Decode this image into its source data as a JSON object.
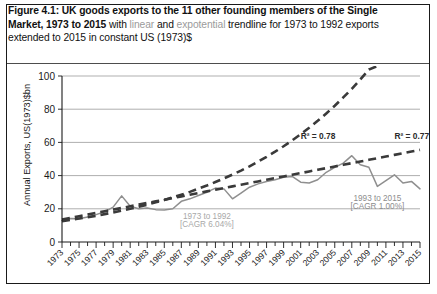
{
  "figure": {
    "caption": {
      "segments": [
        {
          "text": "Figure 4.1: UK goods exports to the 11 other founding members of the Single Market, 1973 to 2015",
          "style": "bold"
        },
        {
          "text": " with ",
          "style": "normal"
        },
        {
          "text": "linear",
          "style": "grey"
        },
        {
          "text": " and ",
          "style": "normal"
        },
        {
          "text": "expotential",
          "style": "grey"
        },
        {
          "text": " trendline for 1973 to 1992 exports extended to 2015 in constant US (1973)$",
          "style": "normal"
        }
      ]
    }
  },
  "chart_data": {
    "type": "line",
    "title": "UK goods exports to the 11 other founding members of the Single Market, 1973 to 2015",
    "xlabel": "",
    "ylabel": "Annual Exports, US(1973)$bn",
    "ylim": [
      0,
      100
    ],
    "yticks": [
      0,
      20,
      40,
      60,
      80,
      100
    ],
    "xlim": [
      1973,
      2015
    ],
    "xticks": [
      1973,
      1975,
      1977,
      1979,
      1981,
      1983,
      1985,
      1987,
      1989,
      1991,
      1993,
      1995,
      1997,
      1999,
      2001,
      2003,
      2005,
      2007,
      2009,
      2011,
      2013,
      2015
    ],
    "grid": "horizontal",
    "legend": "none",
    "x": [
      1973,
      1974,
      1975,
      1976,
      1977,
      1978,
      1979,
      1980,
      1981,
      1982,
      1983,
      1984,
      1985,
      1986,
      1987,
      1988,
      1989,
      1990,
      1991,
      1992,
      1993,
      1994,
      1995,
      1996,
      1997,
      1998,
      1999,
      2000,
      2001,
      2002,
      2003,
      2004,
      2005,
      2006,
      2007,
      2008,
      2009,
      2010,
      2011,
      2012,
      2013,
      2014,
      2015
    ],
    "series": [
      {
        "name": "Actual exports",
        "style": "solid-grey",
        "values": [
          13.0,
          14.2,
          14.0,
          15.0,
          16.5,
          18.2,
          21.0,
          27.8,
          21.5,
          20.0,
          20.5,
          19.5,
          19.3,
          20.0,
          24.5,
          26.0,
          28.0,
          30.0,
          32.5,
          32.0,
          26.0,
          29.5,
          33.0,
          35.0,
          36.5,
          37.5,
          39.0,
          39.5,
          36.0,
          35.5,
          37.5,
          42.0,
          45.0,
          47.5,
          52.0,
          46.5,
          45.0,
          33.5,
          37.0,
          40.5,
          35.5,
          36.5,
          32.0
        ]
      },
      {
        "name": "Expotential trendline (1973-1992 extended)",
        "style": "dashed-dark",
        "r_squared": "R² = 0.78",
        "cagr_basis": "1973 to 1992 [CAGR 6.04%]",
        "values": [
          12.5,
          13.3,
          14.1,
          14.9,
          15.8,
          16.8,
          17.8,
          18.9,
          20.0,
          21.2,
          22.5,
          23.9,
          25.3,
          26.9,
          28.5,
          30.2,
          32.1,
          34.0,
          36.1,
          38.3,
          40.6,
          43.0,
          45.6,
          48.4,
          51.3,
          54.4,
          57.7,
          61.2,
          64.9,
          68.8,
          73.0,
          77.4,
          82.1,
          87.1,
          92.3,
          97.9,
          103.9,
          110.1,
          116.8,
          123.8,
          131.3,
          139.3,
          147.7
        ]
      },
      {
        "name": "Linear trendline (1973-1992 extended)",
        "style": "dashed-dark",
        "r_squared": "R² = 0.77",
        "values": [
          13.5,
          14.5,
          15.5,
          16.5,
          17.5,
          18.5,
          19.5,
          20.5,
          21.5,
          22.5,
          23.5,
          24.5,
          25.5,
          26.5,
          27.5,
          28.5,
          29.5,
          30.5,
          31.5,
          32.5,
          33.5,
          34.5,
          35.5,
          36.5,
          37.5,
          38.5,
          39.5,
          40.5,
          41.5,
          42.5,
          43.5,
          44.5,
          45.5,
          46.5,
          47.5,
          48.5,
          49.5,
          50.5,
          51.5,
          52.5,
          53.5,
          54.5,
          55.5
        ]
      }
    ],
    "annotations": [
      {
        "name": "r2-exponential",
        "text": "R² = 0.78",
        "x": 2001,
        "y": 62,
        "color": "#2b2b2b"
      },
      {
        "name": "r2-linear",
        "text": "R² = 0.77",
        "x": 2012,
        "y": 62,
        "color": "#2b2b2b"
      },
      {
        "name": "early-period-line1",
        "text": "1973 to 1992",
        "x": 1990,
        "y": 14,
        "color": "#a8a8a8"
      },
      {
        "name": "early-period-line2",
        "text": "[CAGR 6.04%]",
        "x": 1990,
        "y": 9,
        "color": "#a8a8a8"
      },
      {
        "name": "late-period-line1",
        "text": "1993 to 2015",
        "x": 2010,
        "y": 25,
        "color": "#8d8d8d"
      },
      {
        "name": "late-period-line2",
        "text": "[CAGR 1.00%]",
        "x": 2010,
        "y": 20,
        "color": "#8d8d8d"
      }
    ]
  },
  "colors": {
    "actual_line": "#8f8f8f",
    "trendline": "#3a3a3a",
    "gridline": "#8c8c8c",
    "axis": "#1a1a1a",
    "caption_grey": "#9b9b9b",
    "frame": "#1a1a1a"
  }
}
